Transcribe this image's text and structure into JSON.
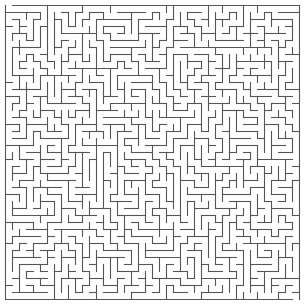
{
  "maze": {
    "rows": 42,
    "cols": 42,
    "entrance": {
      "side": "top",
      "cell": 0
    },
    "exit": {
      "side": "bottom",
      "cell": 41
    },
    "seed": 20240611,
    "wall_color": "#555555",
    "background_color": "#ffffff"
  }
}
